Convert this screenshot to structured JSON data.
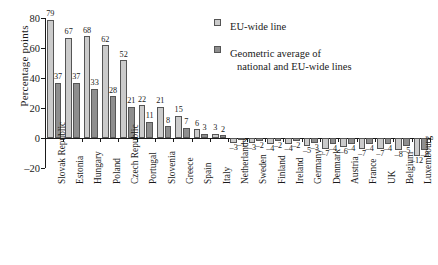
{
  "chart_data": {
    "type": "bar",
    "title": "",
    "xlabel": "",
    "ylabel": "Percentage points",
    "ylim": [
      -20,
      80
    ],
    "yticks": [
      80,
      60,
      40,
      20,
      0,
      -20
    ],
    "grid": false,
    "legend_position": "top-right",
    "categories": [
      "Slovak Republic",
      "Estonia",
      "Hungary",
      "Poland",
      "Czech Republic",
      "Portugal",
      "Slovenia",
      "Greece",
      "Spain",
      "Italy",
      "Netherlands",
      "Sweden",
      "Finland",
      "Ireland",
      "Germany",
      "Denmark",
      "Austria",
      "France",
      "UK",
      "Belgium",
      "Luxembourg"
    ],
    "series": [
      {
        "name": "EU-wide line",
        "color": "#cbcbcb",
        "values": [
          79,
          67,
          68,
          62,
          52,
          22,
          21,
          15,
          6,
          3,
          -3,
          -3,
          -4,
          -4,
          -5,
          -7,
          -6,
          -7,
          -7,
          -8,
          -12
        ]
      },
      {
        "name": "Geometric average of national and EU-wide lines",
        "color": "#8e8e8e",
        "values": [
          37,
          37,
          33,
          28,
          21,
          11,
          8,
          7,
          3,
          2,
          -1,
          -2,
          -2,
          -2,
          -3,
          -4,
          -4,
          -4,
          -4,
          -5,
          -8
        ]
      }
    ]
  },
  "legend": {
    "items": [
      {
        "label": "EU-wide line",
        "label_line2": ""
      },
      {
        "label": "Geometric average of",
        "label_line2": "national and EU-wide lines"
      }
    ]
  },
  "axes": {
    "y_title": "Percentage points",
    "y_tick_labels": [
      "80",
      "60",
      "40",
      "20",
      "0",
      "–20"
    ]
  }
}
